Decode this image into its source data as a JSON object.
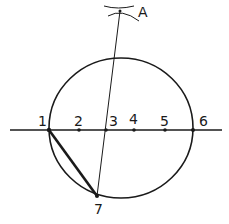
{
  "diagram": {
    "ink_color": "#1a1a1a",
    "background": "#ffffff",
    "circle": {
      "cx": 121,
      "cy": 128,
      "rx": 72,
      "ry": 70
    },
    "diameter_line": {
      "x1": 10,
      "y1": 130,
      "x2": 222,
      "y2": 130
    },
    "points": [
      {
        "label": "1",
        "x": 49,
        "y": 130,
        "label_x": 38,
        "label_y": 126
      },
      {
        "label": "2",
        "x": 79,
        "y": 130,
        "label_x": 74,
        "label_y": 126
      },
      {
        "label": "3",
        "x": 106,
        "y": 130,
        "label_x": 109,
        "label_y": 126
      },
      {
        "label": "4",
        "x": 134,
        "y": 130,
        "label_x": 129,
        "label_y": 124
      },
      {
        "label": "5",
        "x": 165,
        "y": 130,
        "label_x": 160,
        "label_y": 126
      },
      {
        "label": "6",
        "x": 193,
        "y": 130,
        "label_x": 199,
        "label_y": 126
      },
      {
        "label": "7",
        "x": 97,
        "y": 196,
        "label_x": 94,
        "label_y": 214
      }
    ],
    "apex": {
      "label": "A",
      "x": 120,
      "y": 11,
      "label_x": 138,
      "label_y": 17
    },
    "construction_line": {
      "from": "A",
      "through": "3",
      "to": "7"
    },
    "chord": {
      "from": "1",
      "to": "7",
      "bold": true
    }
  }
}
